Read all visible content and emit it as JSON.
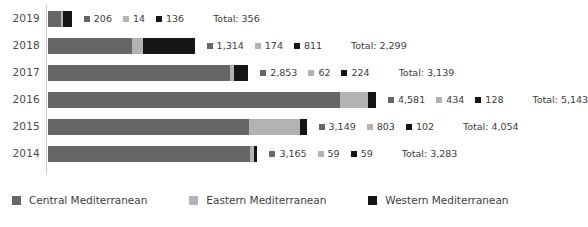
{
  "chart_data": {
    "type": "bar",
    "subtype": "stacked-horizontal",
    "title": "",
    "xlabel": "",
    "ylabel": "",
    "grid": false,
    "legend_position": "bottom",
    "categories": [
      "2019",
      "2018",
      "2017",
      "2016",
      "2015",
      "2014"
    ],
    "series": [
      {
        "name": "Central Mediterranean",
        "color": "#666666",
        "values": [
          206,
          1314,
          2853,
          4581,
          3149,
          3165
        ]
      },
      {
        "name": "Eastern Mediterranean",
        "color": "#b3b3b3",
        "values": [
          14,
          174,
          62,
          434,
          803,
          59
        ]
      },
      {
        "name": "Western Mediterranean",
        "color": "#151515",
        "values": [
          136,
          811,
          224,
          128,
          102,
          59
        ]
      }
    ],
    "totals": [
      356,
      2299,
      3139,
      5143,
      4054,
      3283
    ],
    "total_label_prefix": "Total: ",
    "xlim": [
      0,
      5143
    ],
    "rows": [
      {
        "year": "2019",
        "segments": [
          {
            "series": "Central Mediterranean",
            "value": "206",
            "raw": 206
          },
          {
            "series": "Eastern Mediterranean",
            "value": "14",
            "raw": 14
          },
          {
            "series": "Western Mediterranean",
            "value": "136",
            "raw": 136
          }
        ],
        "total": "Total: 356"
      },
      {
        "year": "2018",
        "segments": [
          {
            "series": "Central Mediterranean",
            "value": "1,314",
            "raw": 1314
          },
          {
            "series": "Eastern Mediterranean",
            "value": "174",
            "raw": 174
          },
          {
            "series": "Western Mediterranean",
            "value": "811",
            "raw": 811
          }
        ],
        "total": "Total: 2,299"
      },
      {
        "year": "2017",
        "segments": [
          {
            "series": "Central Mediterranean",
            "value": "2,853",
            "raw": 2853
          },
          {
            "series": "Eastern Mediterranean",
            "value": "62",
            "raw": 62
          },
          {
            "series": "Western Mediterranean",
            "value": "224",
            "raw": 224
          }
        ],
        "total": "Total: 3,139"
      },
      {
        "year": "2016",
        "segments": [
          {
            "series": "Central Mediterranean",
            "value": "4,581",
            "raw": 4581
          },
          {
            "series": "Eastern Mediterranean",
            "value": "434",
            "raw": 434
          },
          {
            "series": "Western Mediterranean",
            "value": "128",
            "raw": 128
          }
        ],
        "total": "Total: 5,143"
      },
      {
        "year": "2015",
        "segments": [
          {
            "series": "Central Mediterranean",
            "value": "3,149",
            "raw": 3149
          },
          {
            "series": "Eastern Mediterranean",
            "value": "803",
            "raw": 803
          },
          {
            "series": "Western Mediterranean",
            "value": "102",
            "raw": 102
          }
        ],
        "total": "Total: 4,054"
      },
      {
        "year": "2014",
        "segments": [
          {
            "series": "Central Mediterranean",
            "value": "3,165",
            "raw": 3165
          },
          {
            "series": "Eastern Mediterranean",
            "value": "59",
            "raw": 59
          },
          {
            "series": "Western Mediterranean",
            "value": "59",
            "raw": 59
          }
        ],
        "total": "Total: 3,283"
      }
    ],
    "legend": [
      {
        "label": "Central Mediterranean",
        "color": "#666666"
      },
      {
        "label": "Eastern Mediterranean",
        "color": "#b3b3b3"
      },
      {
        "label": "Western Mediterranean",
        "color": "#151515"
      }
    ]
  },
  "layout": {
    "axis_color": "#c9c9c9",
    "text_color": "#3d3d3d"
  }
}
